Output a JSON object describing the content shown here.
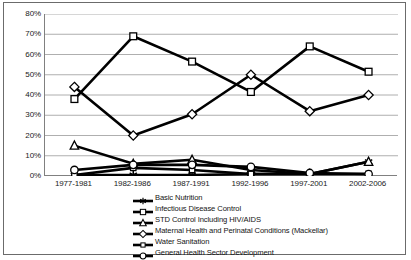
{
  "chart_data": {
    "type": "line",
    "title": "",
    "xlabel": "",
    "ylabel": "",
    "categories": [
      "1977-1981",
      "1982-1986",
      "1987-1991",
      "1992-1996",
      "1997-2001",
      "2002-2006"
    ],
    "ylim": [
      0,
      80
    ],
    "ytick_labels": [
      "0%",
      "10%",
      "20%",
      "30%",
      "40%",
      "50%",
      "60%",
      "70%",
      "80%"
    ],
    "ytick_values": [
      0,
      10,
      20,
      30,
      40,
      50,
      60,
      70,
      80
    ],
    "grid": true,
    "grid_axis": "y",
    "legend_position": "bottom",
    "series": [
      {
        "name": "Basic Nutrition",
        "marker": "star",
        "color": "#000000",
        "values": [
          0.5,
          0.5,
          0.5,
          1.0,
          1.0,
          7.0
        ]
      },
      {
        "name": "Infectious Disease Control",
        "marker": "square",
        "color": "#000000",
        "values": [
          38.0,
          69.0,
          56.5,
          41.5,
          64.0,
          51.5
        ]
      },
      {
        "name": "STD Control Including HIV/AIDS",
        "marker": "triangle",
        "color": "#000000",
        "values": [
          15.0,
          6.0,
          8.0,
          3.0,
          1.0,
          7.0
        ]
      },
      {
        "name": "Maternal Health and Perinatal Conditions (Mackellar)",
        "marker": "diamond",
        "color": "#000000",
        "values": [
          44.0,
          20.0,
          30.5,
          50.0,
          32.0,
          40.0
        ]
      },
      {
        "name": "Water Sanitation",
        "marker": "square-small",
        "color": "#000000",
        "values": [
          0.5,
          4.0,
          3.0,
          1.0,
          1.0,
          1.0
        ]
      },
      {
        "name": "General Health Sector Development",
        "marker": "circle",
        "color": "#000000",
        "values": [
          3.0,
          5.5,
          5.5,
          4.5,
          1.5,
          1.0
        ]
      }
    ]
  },
  "colors": {
    "frame": "#6b6b6b",
    "axis": "#808080",
    "gridline": "#9a9a9a",
    "line": "#000000",
    "marker_fill": "#ffffff",
    "text": "#1a1a1a",
    "background": "#ffffff"
  }
}
